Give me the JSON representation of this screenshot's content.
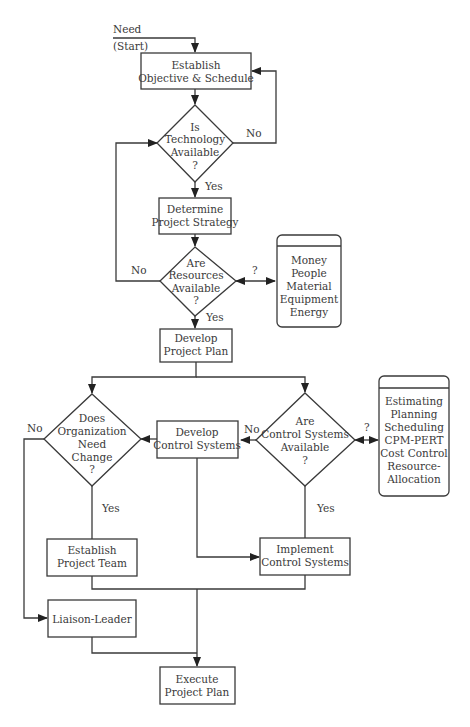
{
  "diagram": {
    "type": "flowchart",
    "start": {
      "need": "Need",
      "start": "(Start)"
    },
    "nodes": {
      "establish_objective": [
        "Establish",
        "Objective & Schedule"
      ],
      "is_technology_available": [
        "Is",
        "Technology",
        "Available",
        "?"
      ],
      "determine_strategy": [
        "Determine",
        "Project Strategy"
      ],
      "are_resources_available": [
        "Are",
        "Resources",
        "Available",
        "?"
      ],
      "resources_list": [
        "Money",
        "People",
        "Material",
        "Equipment",
        "Energy"
      ],
      "develop_plan": [
        "Develop",
        "Project Plan"
      ],
      "does_org_need_change": [
        "Does",
        "Organization",
        "Need",
        "Change",
        "?"
      ],
      "develop_control_systems": [
        "Develop",
        "Control Systems"
      ],
      "are_control_systems_available": [
        "Are",
        "Control Systems",
        "Available",
        "?"
      ],
      "control_tools_list": [
        "Estimating",
        "Planning",
        "Scheduling",
        "CPM-PERT",
        "Cost Control",
        "Resource-",
        "Allocation"
      ],
      "establish_team": [
        "Establish",
        "Project Team"
      ],
      "implement_control_systems": [
        "Implement",
        "Control Systems"
      ],
      "liaison_leader": [
        "Liaison-Leader"
      ],
      "execute_plan": [
        "Execute",
        "Project Plan"
      ]
    },
    "edge_labels": {
      "tech_no": "No",
      "tech_yes": "Yes",
      "resources_no": "No",
      "resources_yes": "Yes",
      "resources_query": "?",
      "org_no": "No",
      "org_yes": "Yes",
      "control_no": "No",
      "control_yes": "Yes",
      "control_query": "?"
    }
  }
}
